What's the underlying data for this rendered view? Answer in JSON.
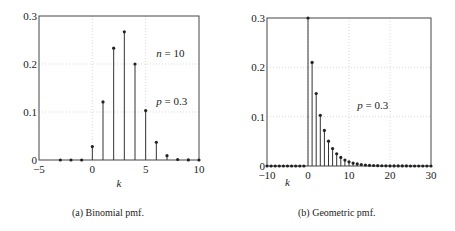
{
  "chart_data": [
    {
      "type": "stem",
      "caption": "(a) Binomial pmf.",
      "xlabel": "k",
      "ylabel": "",
      "xlim": [
        -5,
        10
      ],
      "ylim": [
        0,
        0.3
      ],
      "xticks": [
        -5,
        0,
        5,
        10
      ],
      "yticks": [
        0,
        0.1,
        0.2,
        0.3
      ],
      "xtick_labels": [
        "−5",
        "0",
        "5",
        "10"
      ],
      "ytick_labels": [
        "0",
        "0.1",
        "0.2",
        "0.3"
      ],
      "grid": true,
      "annotations": [
        {
          "text": "n = 10",
          "x": 6,
          "y": 0.215
        },
        {
          "text": "p = 0.3",
          "x": 6,
          "y": 0.115
        }
      ],
      "x": [
        -3,
        -2,
        -1,
        0,
        1,
        2,
        3,
        4,
        5,
        6,
        7,
        8,
        9,
        10
      ],
      "values": [
        0,
        0,
        0,
        0.028,
        0.121,
        0.233,
        0.267,
        0.2,
        0.103,
        0.037,
        0.009,
        0.001,
        0.0001,
        5.9e-06
      ]
    },
    {
      "type": "stem",
      "caption": "(b) Geometric pmf.",
      "xlabel": "k",
      "ylabel": "",
      "xlim": [
        -10,
        30
      ],
      "ylim": [
        0,
        0.3
      ],
      "xticks": [
        -10,
        0,
        10,
        20,
        30
      ],
      "yticks": [
        0,
        0.1,
        0.2,
        0.3
      ],
      "xtick_labels": [
        "−10",
        "0",
        "10",
        "20",
        "30"
      ],
      "ytick_labels": [
        "0",
        "0.1",
        "0.2",
        "0.3"
      ],
      "grid": true,
      "annotations": [
        {
          "text": "p = 0.3",
          "x": 12,
          "y": 0.115
        }
      ],
      "formula": "p(1-p)^k for k >= 0",
      "p": 0.3,
      "x_range": [
        -10,
        30
      ]
    }
  ],
  "captions": {
    "a": "(a) Binomial pmf.",
    "b": "(b) Geometric pmf."
  },
  "labels": {
    "a_n": "n = 10",
    "a_p": "p = 0.3",
    "b_p": "p = 0.3",
    "k": "k"
  }
}
